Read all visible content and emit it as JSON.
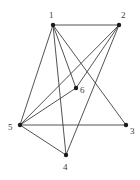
{
  "figure": {
    "type": "undirected-graph-drawing",
    "width": 140,
    "height": 180,
    "background_color": "#ffffff",
    "edge_color": "#404040",
    "node_color": "#1a1a1a",
    "label_color": "#3a3a3a",
    "edge_width": 0.9,
    "node_radius": 2.2
  },
  "graph_data": {
    "type": "node-link-diagram",
    "node_count": 6,
    "edge_count": 11,
    "nodes": [
      {
        "id": "1",
        "label": "1",
        "x": 53,
        "y": 25,
        "label_x": 49,
        "label_y": 11
      },
      {
        "id": "2",
        "label": "2",
        "x": 119,
        "y": 25,
        "label_x": 121,
        "label_y": 11
      },
      {
        "id": "3",
        "label": "3",
        "x": 126,
        "y": 125,
        "label_x": 130,
        "label_y": 127
      },
      {
        "id": "4",
        "label": "4",
        "x": 66,
        "y": 155,
        "label_x": 63,
        "label_y": 163
      },
      {
        "id": "5",
        "label": "5",
        "x": 20,
        "y": 125,
        "label_x": 8,
        "label_y": 123
      },
      {
        "id": "6",
        "label": "6",
        "x": 76,
        "y": 88,
        "label_x": 80,
        "label_y": 86
      }
    ],
    "edges": [
      {
        "source": "1",
        "target": "5"
      },
      {
        "source": "1",
        "target": "4"
      },
      {
        "source": "1",
        "target": "6"
      },
      {
        "source": "1",
        "target": "3"
      },
      {
        "source": "1",
        "target": "2"
      },
      {
        "source": "2",
        "target": "5"
      },
      {
        "source": "2",
        "target": "4"
      },
      {
        "source": "2",
        "target": "6"
      },
      {
        "source": "5",
        "target": "3"
      },
      {
        "source": "5",
        "target": "6"
      },
      {
        "source": "5",
        "target": "4"
      }
    ]
  }
}
